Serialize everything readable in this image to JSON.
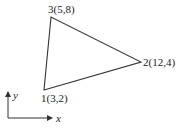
{
  "diagram": {
    "type": "triangle-element",
    "nodes": [
      {
        "label": "1(3,2)",
        "id": "1",
        "x": 3,
        "y": 2
      },
      {
        "label": "2(12,4)",
        "id": "2",
        "x": 12,
        "y": 4
      },
      {
        "label": "3(5,8)",
        "id": "3",
        "x": 5,
        "y": 8
      }
    ],
    "axes": {
      "x_label": "x",
      "y_label": "y"
    },
    "line_color": "#333333"
  }
}
